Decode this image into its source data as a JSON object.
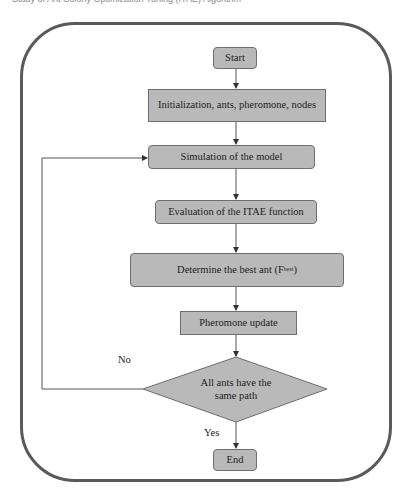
{
  "caption": "Study of Ant Colony Optimization Tuning (ITAE) Algorithm",
  "flowchart": {
    "start": "Start",
    "init": "Initialization, ants, pheromone, nodes",
    "simulation": "Simulation of the model",
    "evaluation": "Evaluation of the ITAE function",
    "determine": "Determine the best ant (F",
    "determine_sub": "best",
    "determine_close": ")",
    "pheromone": "Pheromone update",
    "decision_line1": "All ants have the",
    "decision_line2": "same path",
    "no_label": "No",
    "yes_label": "Yes",
    "end": "End"
  },
  "colors": {
    "box_fill": "#b9b9b9",
    "box_border": "#6e6e6e",
    "frame_border": "#5a5a5a",
    "arrow": "#333333"
  }
}
